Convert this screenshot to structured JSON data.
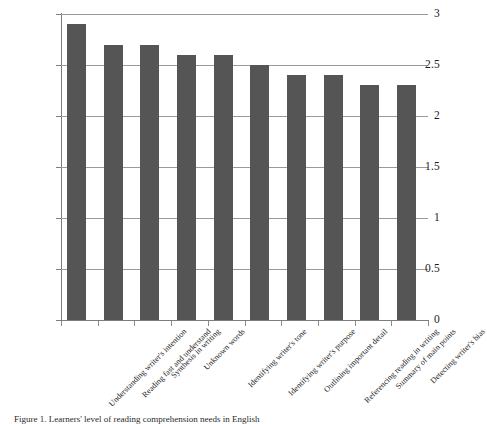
{
  "figure": {
    "caption": "Figure 1. Learners' level of reading comprehension needs in English",
    "bar_color": "#555555",
    "gridline_color": "#9a9a9a",
    "axis_color": "#7d7d7d",
    "background": "#ffffff"
  },
  "chart_data": {
    "type": "bar",
    "title": "",
    "xlabel": "",
    "ylabel": "",
    "ylim": [
      0,
      3
    ],
    "grid": true,
    "legend": "none",
    "ytick_labels": [
      "3",
      "2.5",
      "2",
      "1.5",
      "1",
      "0.5",
      "0"
    ],
    "ytick_values": [
      3,
      2.5,
      2,
      1.5,
      1,
      0.5,
      0
    ],
    "categories": [
      "Understanding writer's intention",
      "Reading fast and understand",
      "Synthesis in writing",
      "Unknown words",
      "Identifying writer's tone",
      "Identifying writer's purpose",
      "Outlining important detail",
      "Referencing reading in writing",
      "Summary of main points",
      "Detecting writer's bias"
    ],
    "values": [
      2.9,
      2.7,
      2.7,
      2.6,
      2.6,
      2.5,
      2.4,
      2.4,
      2.3,
      2.3
    ]
  }
}
